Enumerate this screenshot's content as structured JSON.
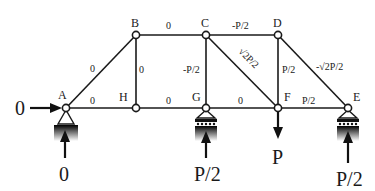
{
  "nodes": {
    "A": {
      "label": "A"
    },
    "B": {
      "label": "B"
    },
    "C": {
      "label": "C"
    },
    "D": {
      "label": "D"
    },
    "E": {
      "label": "E"
    },
    "F": {
      "label": "F"
    },
    "G": {
      "label": "G"
    },
    "H": {
      "label": "H"
    }
  },
  "members": {
    "AB": "0",
    "AH": "0",
    "BH": "0",
    "BC": "0",
    "HG": "0",
    "CG": "-P/2",
    "CD": "-P/2",
    "CF": "√2P/2",
    "GF": "0",
    "DF": "P/2",
    "DE": "-√2P/2",
    "FE": "P/2"
  },
  "loads": {
    "A_horizontal": "0",
    "A_vertical": "0",
    "G_reaction": "P/2",
    "F_load": "P",
    "E_reaction": "P/2"
  }
}
